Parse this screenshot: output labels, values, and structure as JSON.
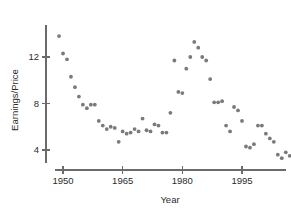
{
  "chart_data": {
    "type": "scatter",
    "title": "",
    "xlabel": "Year",
    "ylabel": "Earnings/Price",
    "xlim": [
      1948,
      2001
    ],
    "ylim": [
      2.2,
      14.6
    ],
    "xticks": [
      1950,
      1965,
      1980,
      1995
    ],
    "xtick_labels": [
      "1950",
      "1965",
      "1980",
      "1995"
    ],
    "yticks": [
      4,
      8,
      12
    ],
    "ytick_labels": [
      "4",
      "8",
      "12"
    ],
    "grid": false,
    "legend": "none",
    "marker": "filled-circle",
    "marker_color": "#7a7a7a",
    "points": [
      {
        "x": 1949,
        "y": 13.8
      },
      {
        "x": 1950,
        "y": 12.3
      },
      {
        "x": 1951,
        "y": 11.8
      },
      {
        "x": 1952,
        "y": 10.3
      },
      {
        "x": 1953,
        "y": 9.4
      },
      {
        "x": 1954,
        "y": 8.6
      },
      {
        "x": 1955,
        "y": 7.9
      },
      {
        "x": 1956,
        "y": 7.6
      },
      {
        "x": 1957,
        "y": 7.9
      },
      {
        "x": 1958,
        "y": 7.9
      },
      {
        "x": 1959,
        "y": 6.5
      },
      {
        "x": 1960,
        "y": 6.1
      },
      {
        "x": 1961,
        "y": 5.8
      },
      {
        "x": 1962,
        "y": 6.0
      },
      {
        "x": 1963,
        "y": 5.9
      },
      {
        "x": 1964,
        "y": 4.7
      },
      {
        "x": 1965,
        "y": 5.6
      },
      {
        "x": 1966,
        "y": 5.4
      },
      {
        "x": 1967,
        "y": 5.5
      },
      {
        "x": 1968,
        "y": 5.8
      },
      {
        "x": 1969,
        "y": 5.6
      },
      {
        "x": 1970,
        "y": 6.7
      },
      {
        "x": 1971,
        "y": 5.7
      },
      {
        "x": 1972,
        "y": 5.6
      },
      {
        "x": 1973,
        "y": 6.2
      },
      {
        "x": 1974,
        "y": 6.1
      },
      {
        "x": 1975,
        "y": 5.5
      },
      {
        "x": 1976,
        "y": 5.5
      },
      {
        "x": 1977,
        "y": 7.2
      },
      {
        "x": 1978,
        "y": 11.7
      },
      {
        "x": 1979,
        "y": 9.0
      },
      {
        "x": 1980,
        "y": 8.9
      },
      {
        "x": 1981,
        "y": 11.0
      },
      {
        "x": 1982,
        "y": 12.0
      },
      {
        "x": 1983,
        "y": 13.3
      },
      {
        "x": 1984,
        "y": 12.8
      },
      {
        "x": 1985,
        "y": 12.0
      },
      {
        "x": 1986,
        "y": 11.7
      },
      {
        "x": 1987,
        "y": 10.1
      },
      {
        "x": 1988,
        "y": 8.1
      },
      {
        "x": 1989,
        "y": 8.1
      },
      {
        "x": 1990,
        "y": 8.2
      },
      {
        "x": 1991,
        "y": 6.1
      },
      {
        "x": 1992,
        "y": 5.6
      },
      {
        "x": 1993,
        "y": 7.7
      },
      {
        "x": 1994,
        "y": 7.4
      },
      {
        "x": 1995,
        "y": 6.5
      },
      {
        "x": 1996,
        "y": 4.3
      },
      {
        "x": 1997,
        "y": 4.2
      },
      {
        "x": 1998,
        "y": 4.5
      },
      {
        "x": 1999,
        "y": 6.1
      },
      {
        "x": 2000,
        "y": 6.1
      },
      {
        "x": 2001,
        "y": 5.4
      },
      {
        "x": 2002,
        "y": 5.0
      },
      {
        "x": 2003,
        "y": 4.7
      },
      {
        "x": 2004,
        "y": 3.6
      },
      {
        "x": 2005,
        "y": 3.3
      },
      {
        "x": 2006,
        "y": 3.8
      },
      {
        "x": 2007,
        "y": 3.5
      },
      {
        "x": 2008,
        "y": 3.0
      },
      {
        "x": 2009,
        "y": 3.0
      },
      {
        "x": 2010,
        "y": 3.5
      },
      {
        "x": 2011,
        "y": 4.0
      }
    ]
  },
  "axes": {
    "y_axis_label": "Earnings/Price",
    "x_axis_label": "Year"
  }
}
